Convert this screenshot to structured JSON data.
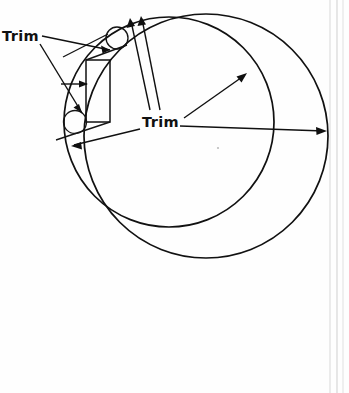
{
  "figure": {
    "type": "technical-line-drawing",
    "background_color": "#fefefe",
    "ink_color": "#111111",
    "labels": {
      "left_trim": "Trim",
      "center_trim": "Trim"
    },
    "annotations": [
      {
        "name": "left-trim-label",
        "text": "Trim",
        "x": 2,
        "y": 41
      },
      {
        "name": "center-trim-label",
        "text": "Trim",
        "x": 142,
        "y": 127
      }
    ],
    "geometry": {
      "outer_circle": {
        "cx": 206,
        "cy": 136,
        "r": 122
      },
      "inner_circle": {
        "cx": 169,
        "cy": 122,
        "r": 105
      },
      "upper_roller": {
        "cx": 117,
        "cy": 38,
        "r": 11
      },
      "lower_roller": {
        "cx": 75,
        "cy": 122,
        "r": 11.5
      },
      "tool_rect": {
        "x": 86,
        "y": 60,
        "width": 24,
        "height": 62
      }
    },
    "leader_lines": [
      {
        "name": "left-trim-to-upper-roller",
        "from": [
          42,
          36
        ],
        "to": [
          110,
          50
        ]
      },
      {
        "name": "left-trim-to-lower-roller",
        "from": [
          40,
          44
        ],
        "to": [
          82,
          113
        ]
      },
      {
        "name": "horizontal-arrow-into-rect",
        "from": [
          62,
          84
        ],
        "to": [
          87,
          84
        ]
      },
      {
        "name": "center-trim-to-top-left-arc",
        "from": [
          150,
          110
        ],
        "to": [
          131,
          20
        ]
      },
      {
        "name": "center-trim-to-top-arc",
        "from": [
          160,
          110
        ],
        "to": [
          141,
          18
        ]
      },
      {
        "name": "center-trim-to-inner-circle",
        "from": [
          184,
          118
        ],
        "to": [
          246,
          74
        ]
      },
      {
        "name": "center-trim-to-outer-circle-right",
        "from": [
          180,
          126
        ],
        "to": [
          326,
          131
        ]
      },
      {
        "name": "center-trim-to-lower-left",
        "from": [
          140,
          128
        ],
        "to": [
          72,
          146
        ]
      }
    ],
    "scan_artifact_lines": [
      {
        "x": 330,
        "color": "#d8d8d8"
      },
      {
        "x": 337,
        "color": "#cfcfcf"
      },
      {
        "x": 343,
        "color": "#e0e0e0"
      }
    ]
  }
}
